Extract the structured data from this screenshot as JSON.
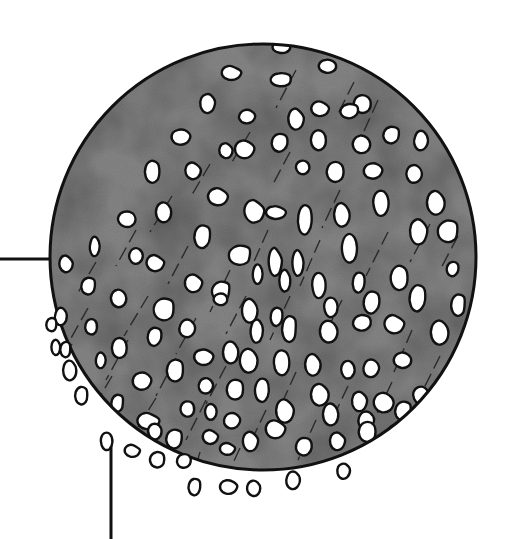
{
  "illustration": {
    "subject": "magnified-circular-cross-section",
    "colors": {
      "background": "#ffffff",
      "disc_fill": "#858585",
      "disc_shade": "#6e6e6e",
      "outline": "#111111",
      "blob_fill": "#ffffff",
      "streak": "#2a2a2a"
    },
    "disc": {
      "cx": 263,
      "cy": 257,
      "r": 213
    },
    "leader_lines": [
      {
        "name": "horizontal-leader-line",
        "x1": 0,
        "y1": 259,
        "x2": 51,
        "y2": 259
      },
      {
        "name": "vertical-leader-line",
        "x1": 111,
        "y1": 446,
        "x2": 111,
        "y2": 539
      }
    ],
    "inner_blobs": [
      [
        281,
        48,
        9,
        6
      ],
      [
        231,
        72,
        9,
        7
      ],
      [
        282,
        80,
        10,
        6
      ],
      [
        328,
        66,
        8,
        6
      ],
      [
        363,
        104,
        8,
        8
      ],
      [
        207,
        102,
        7,
        10
      ],
      [
        246,
        116,
        8,
        7
      ],
      [
        296,
        118,
        7,
        10
      ],
      [
        320,
        108,
        8,
        7
      ],
      [
        350,
        112,
        9,
        7
      ],
      [
        180,
        136,
        9,
        8
      ],
      [
        226,
        150,
        6,
        7
      ],
      [
        244,
        148,
        9,
        9
      ],
      [
        280,
        144,
        8,
        9
      ],
      [
        319,
        140,
        7,
        9
      ],
      [
        362,
        144,
        8,
        8
      ],
      [
        392,
        136,
        8,
        8
      ],
      [
        420,
        140,
        7,
        10
      ],
      [
        153,
        172,
        7,
        10
      ],
      [
        193,
        170,
        7,
        8
      ],
      [
        302,
        168,
        7,
        7
      ],
      [
        336,
        172,
        8,
        9
      ],
      [
        372,
        170,
        9,
        8
      ],
      [
        413,
        174,
        8,
        9
      ],
      [
        218,
        196,
        9,
        8
      ],
      [
        164,
        212,
        7,
        9
      ],
      [
        254,
        210,
        9,
        11
      ],
      [
        276,
        212,
        9,
        6
      ],
      [
        305,
        222,
        7,
        15
      ],
      [
        342,
        214,
        7,
        11
      ],
      [
        380,
        204,
        8,
        13
      ],
      [
        436,
        202,
        8,
        11
      ],
      [
        126,
        220,
        9,
        8
      ],
      [
        94,
        246,
        5,
        10
      ],
      [
        135,
        256,
        7,
        8
      ],
      [
        203,
        238,
        8,
        11
      ],
      [
        241,
        256,
        11,
        9
      ],
      [
        275,
        260,
        6,
        14
      ],
      [
        298,
        262,
        5,
        12
      ],
      [
        350,
        248,
        7,
        13
      ],
      [
        418,
        230,
        8,
        13
      ],
      [
        449,
        232,
        10,
        10
      ],
      [
        66,
        263,
        6,
        8
      ],
      [
        89,
        287,
        7,
        8
      ],
      [
        155,
        262,
        8,
        8
      ],
      [
        193,
        282,
        8,
        9
      ],
      [
        222,
        292,
        9,
        9
      ],
      [
        257,
        274,
        5,
        10
      ],
      [
        285,
        280,
        5,
        10
      ],
      [
        318,
        286,
        7,
        13
      ],
      [
        359,
        284,
        6,
        10
      ],
      [
        400,
        278,
        8,
        11
      ],
      [
        453,
        270,
        6,
        7
      ],
      [
        119,
        298,
        7,
        8
      ],
      [
        165,
        310,
        10,
        10
      ],
      [
        220,
        300,
        7,
        6
      ],
      [
        250,
        310,
        7,
        11
      ],
      [
        277,
        318,
        6,
        9
      ],
      [
        330,
        308,
        7,
        10
      ],
      [
        372,
        304,
        8,
        11
      ],
      [
        418,
        300,
        8,
        13
      ],
      [
        459,
        306,
        7,
        10
      ],
      [
        91,
        328,
        6,
        8
      ],
      [
        155,
        338,
        7,
        9
      ],
      [
        186,
        328,
        8,
        9
      ],
      [
        256,
        330,
        6,
        12
      ],
      [
        290,
        330,
        7,
        12
      ],
      [
        329,
        331,
        8,
        10
      ],
      [
        362,
        324,
        9,
        8
      ],
      [
        394,
        323,
        9,
        9
      ],
      [
        440,
        332,
        8,
        11
      ],
      [
        120,
        348,
        7,
        9
      ],
      [
        203,
        356,
        9,
        8
      ],
      [
        231,
        352,
        7,
        10
      ],
      [
        249,
        360,
        8,
        11
      ],
      [
        281,
        364,
        8,
        13
      ],
      [
        313,
        364,
        7,
        10
      ],
      [
        347,
        370,
        7,
        9
      ],
      [
        370,
        368,
        8,
        9
      ],
      [
        403,
        360,
        8,
        7
      ],
      [
        100,
        360,
        5,
        8
      ],
      [
        141,
        380,
        9,
        9
      ],
      [
        176,
        371,
        8,
        10
      ],
      [
        205,
        385,
        7,
        8
      ],
      [
        236,
        390,
        8,
        9
      ],
      [
        262,
        392,
        7,
        12
      ],
      [
        320,
        394,
        8,
        10
      ],
      [
        359,
        400,
        7,
        10
      ],
      [
        384,
        402,
        9,
        9
      ],
      [
        420,
        396,
        8,
        9
      ],
      [
        118,
        404,
        6,
        8
      ],
      [
        148,
        420,
        10,
        8
      ],
      [
        187,
        410,
        7,
        8
      ],
      [
        210,
        412,
        6,
        8
      ],
      [
        231,
        420,
        8,
        8
      ],
      [
        285,
        410,
        8,
        11
      ],
      [
        331,
        414,
        7,
        10
      ],
      [
        365,
        420,
        8,
        9
      ],
      [
        404,
        412,
        8,
        9
      ],
      [
        175,
        440,
        8,
        9
      ],
      [
        210,
        436,
        7,
        7
      ],
      [
        227,
        448,
        7,
        6
      ],
      [
        250,
        440,
        7,
        10
      ],
      [
        275,
        428,
        9,
        9
      ],
      [
        304,
        448,
        8,
        9
      ],
      [
        337,
        440,
        7,
        9
      ],
      [
        368,
        432,
        8,
        9
      ],
      [
        395,
        434,
        7,
        8
      ],
      [
        154,
        432,
        7,
        8
      ]
    ],
    "outer_blobs": [
      [
        60,
        316,
        6,
        9
      ],
      [
        56,
        347,
        4,
        7
      ],
      [
        70,
        370,
        6,
        9
      ],
      [
        106,
        442,
        6,
        9
      ],
      [
        132,
        450,
        7,
        6
      ],
      [
        158,
        460,
        7,
        7
      ],
      [
        184,
        462,
        7,
        7
      ],
      [
        195,
        488,
        6,
        8
      ],
      [
        228,
        486,
        8,
        7
      ],
      [
        254,
        488,
        6,
        7
      ],
      [
        292,
        480,
        7,
        9
      ],
      [
        343,
        470,
        6,
        8
      ],
      [
        82,
        396,
        6,
        8
      ],
      [
        52,
        325,
        5,
        6
      ],
      [
        66,
        350,
        5,
        7
      ]
    ],
    "streaks": [
      [
        296,
        70,
        276,
        108
      ],
      [
        354,
        82,
        336,
        118
      ],
      [
        378,
        100,
        360,
        140
      ],
      [
        250,
        132,
        232,
        162
      ],
      [
        290,
        152,
        272,
        186
      ],
      [
        210,
        164,
        190,
        198
      ],
      [
        340,
        190,
        322,
        228
      ],
      [
        172,
        196,
        150,
        232
      ],
      [
        136,
        230,
        116,
        266
      ],
      [
        96,
        262,
        76,
        296
      ],
      [
        188,
        246,
        168,
        284
      ],
      [
        230,
        270,
        210,
        312
      ],
      [
        268,
        230,
        252,
        266
      ],
      [
        320,
        240,
        300,
        286
      ],
      [
        388,
        232,
        366,
        276
      ],
      [
        430,
        224,
        410,
        262
      ],
      [
        148,
        296,
        124,
        336
      ],
      [
        196,
        318,
        176,
        354
      ],
      [
        246,
        296,
        226,
        334
      ],
      [
        290,
        296,
        270,
        340
      ],
      [
        342,
        300,
        322,
        340
      ],
      [
        412,
        330,
        394,
        372
      ],
      [
        458,
        236,
        440,
        270
      ],
      [
        128,
        340,
        106,
        380
      ],
      [
        176,
        358,
        156,
        396
      ],
      [
        226,
        366,
        206,
        404
      ],
      [
        296,
        372,
        278,
        412
      ],
      [
        348,
        386,
        330,
        424
      ],
      [
        392,
        382,
        374,
        420
      ],
      [
        440,
        356,
        422,
        392
      ],
      [
        156,
        398,
        136,
        430
      ],
      [
        206,
        400,
        186,
        440
      ],
      [
        266,
        410,
        248,
        448
      ],
      [
        316,
        420,
        298,
        460
      ],
      [
        378,
        440,
        362,
        470
      ],
      [
        112,
        376,
        92,
        410
      ],
      [
        88,
        308,
        70,
        340
      ],
      [
        72,
        344,
        58,
        372
      ],
      [
        240,
        448,
        226,
        478
      ],
      [
        200,
        452,
        192,
        480
      ]
    ]
  }
}
